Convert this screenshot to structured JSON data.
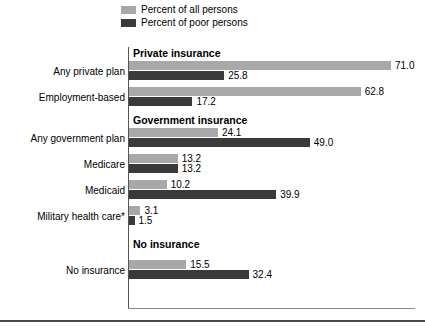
{
  "legend": {
    "items": [
      {
        "label": "Percent of all persons",
        "color": "#a8a8a8",
        "key": "all"
      },
      {
        "label": "Percent of poor persons",
        "color": "#3a3a3a",
        "key": "poor"
      }
    ]
  },
  "chart_data": {
    "type": "bar",
    "orientation": "horizontal",
    "title": "",
    "subtitle": "",
    "xlabel": "",
    "ylabel": "",
    "xlim": [
      0,
      71.0
    ],
    "grid": false,
    "legend_position": "top",
    "categories": [
      "Any private plan",
      "Employment-based",
      "Any government plan",
      "Medicare",
      "Medicaid",
      "Military health care*",
      "No insurance"
    ],
    "series": [
      {
        "name": "Percent of all persons",
        "color": "#a8a8a8",
        "values": [
          71.0,
          62.8,
          24.1,
          13.2,
          10.2,
          3.1,
          15.5
        ]
      },
      {
        "name": "Percent of poor persons",
        "color": "#3a3a3a",
        "values": [
          25.8,
          17.2,
          49.0,
          13.2,
          39.9,
          1.5,
          32.4
        ]
      }
    ],
    "groups": [
      {
        "header": "Private insurance",
        "categories": [
          "Any private plan",
          "Employment-based"
        ]
      },
      {
        "header": "Government insurance",
        "categories": [
          "Any government plan",
          "Medicare",
          "Medicaid",
          "Military health care*"
        ]
      },
      {
        "header": "No insurance",
        "categories": [
          "No insurance"
        ]
      }
    ],
    "annotations": [
      "*"
    ]
  },
  "rows": [
    {
      "kind": "header",
      "text": "Private insurance",
      "top": 0
    },
    {
      "kind": "bars",
      "label": "Any private plan",
      "top": 14,
      "all": {
        "value": "71.0",
        "num": 71.0
      },
      "poor": {
        "value": "25.8",
        "num": 25.8
      }
    },
    {
      "kind": "bars",
      "label": "Employment-based",
      "top": 40,
      "all": {
        "value": "62.8",
        "num": 62.8
      },
      "poor": {
        "value": "17.2",
        "num": 17.2
      }
    },
    {
      "kind": "header",
      "text": "Government insurance",
      "top": 67
    },
    {
      "kind": "bars",
      "label": "Any government plan",
      "top": 81,
      "all": {
        "value": "24.1",
        "num": 24.1
      },
      "poor": {
        "value": "49.0",
        "num": 49.0
      }
    },
    {
      "kind": "bars",
      "label": "Medicare",
      "top": 107,
      "all": {
        "value": "13.2",
        "num": 13.2
      },
      "poor": {
        "value": "13.2",
        "num": 13.2
      }
    },
    {
      "kind": "bars",
      "label": "Medicaid",
      "top": 133,
      "all": {
        "value": "10.2",
        "num": 10.2
      },
      "poor": {
        "value": "39.9",
        "num": 39.9
      }
    },
    {
      "kind": "bars",
      "label": "Military health care*",
      "top": 159,
      "all": {
        "value": "3.1",
        "num": 3.1
      },
      "poor": {
        "value": "1.5",
        "num": 1.5
      }
    },
    {
      "kind": "header",
      "text": "No insurance",
      "top": 191,
      "top_extra": 0
    },
    {
      "kind": "bars",
      "label": "No insurance",
      "top": 213,
      "all": {
        "value": "15.5",
        "num": 15.5
      },
      "poor": {
        "value": "32.4",
        "num": 32.4
      }
    }
  ],
  "scale": {
    "px_per_unit": 3.69,
    "bar_origin_x": 129
  }
}
